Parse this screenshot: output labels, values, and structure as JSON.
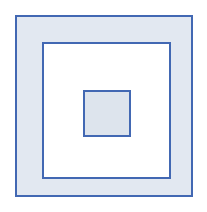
{
  "figure": {
    "background_color": "#ffffff",
    "stroke_color": "#4268b3",
    "stroke_width_px": 2
  },
  "chart_data": {
    "type": "diagram",
    "shapes": [
      {
        "name": "outer-square",
        "index": 1,
        "x": 15,
        "y": 15,
        "width": 178,
        "height": 182,
        "fill": "#e2e8f1",
        "stroke": "#4268b3",
        "stroke_width": 2
      },
      {
        "name": "middle-square",
        "index": 2,
        "x": 40,
        "y": 40,
        "width": 129,
        "height": 137,
        "fill": "#ffffff",
        "stroke": "#4268b3",
        "stroke_width": 2
      },
      {
        "name": "inner-square",
        "index": 3,
        "x": 79,
        "y": 86,
        "width": 48,
        "height": 47,
        "fill": "#dde4ed",
        "stroke": "#4268b3",
        "stroke_width": 2
      }
    ],
    "count": 3,
    "xlim": [
      0,
      207
    ],
    "ylim": [
      0,
      212
    ],
    "grid": false,
    "legend": false
  }
}
